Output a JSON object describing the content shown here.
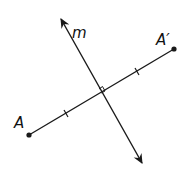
{
  "diagram": {
    "type": "reflection",
    "labels": {
      "line": "m",
      "point": "A",
      "image_point": "A′"
    },
    "colors": {
      "stroke": "#1a1a1a",
      "background": "#ffffff"
    },
    "points": {
      "A": [
        29,
        135
      ],
      "A_prime": [
        174,
        49
      ],
      "m_start": [
        60,
        17
      ],
      "m_end": [
        143,
        165
      ],
      "intersection": [
        101,
        93
      ]
    },
    "annotations": [
      "right-angle marker at intersection",
      "congruence tick marks on each half of segment AA′"
    ]
  }
}
